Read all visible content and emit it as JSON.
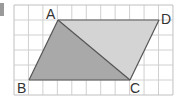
{
  "figure": {
    "type": "parallelogram-on-grid",
    "grid": {
      "x0": 14,
      "y0": 5,
      "cols": 11,
      "rows": 6,
      "cell_w": 14.45,
      "cell_h": 15,
      "line_color": "#d0d0d0",
      "border_color": "#c0c0c0"
    },
    "points": {
      "A": {
        "label": "A",
        "x": 58,
        "y": 20
      },
      "B": {
        "label": "B",
        "x": 29,
        "y": 80
      },
      "C": {
        "label": "C",
        "x": 130,
        "y": 80
      },
      "D": {
        "label": "D",
        "x": 159,
        "y": 20
      }
    },
    "triangle_ABC_fill": "#a9a9a9",
    "triangle_ACD_fill": "#d4d4d4",
    "edge_color": "#555555"
  }
}
